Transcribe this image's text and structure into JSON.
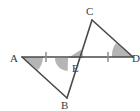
{
  "figure": {
    "background_color": "#ffffff",
    "stroke_color": "#4a4a4a",
    "angle_fill_color": "#9e9e9e",
    "label_color": "#3a3a3a",
    "points": {
      "A": {
        "x": 22,
        "y": 57,
        "label": "A",
        "label_x": 10,
        "label_y": 62
      },
      "B": {
        "x": 67,
        "y": 98,
        "label": "B",
        "label_x": 61,
        "label_y": 109
      },
      "C": {
        "x": 92,
        "y": 20,
        "label": "C",
        "label_x": 86,
        "label_y": 15
      },
      "D": {
        "x": 133,
        "y": 57,
        "label": "D",
        "label_x": 132,
        "label_y": 62
      },
      "E": {
        "x": 68,
        "y": 58,
        "label": "E",
        "label_x": 72,
        "label_y": 72
      }
    },
    "segments": [
      {
        "name": "segment-AD",
        "from": "A",
        "to": "D"
      },
      {
        "name": "segment-AB",
        "from": "A",
        "to": "B"
      },
      {
        "name": "segment-BC",
        "from": "B",
        "to": "C"
      },
      {
        "name": "segment-CD",
        "from": "C",
        "to": "D"
      }
    ],
    "tick_marks": [
      {
        "name": "tick-AE",
        "x": 46,
        "y": 57,
        "segment": "AE",
        "count": 1
      },
      {
        "name": "tick-ED",
        "x": 108,
        "y": 57,
        "segment": "ED",
        "count": 1
      }
    ],
    "angle_marks": [
      {
        "name": "angle-A",
        "vertex": "A",
        "shaded": true
      },
      {
        "name": "angle-D",
        "vertex": "D",
        "shaded": true
      },
      {
        "name": "angle-AEB",
        "vertex": "E",
        "shaded": true
      },
      {
        "name": "angle-CED",
        "vertex": "E",
        "shaded": true
      }
    ],
    "labels": [
      "A",
      "B",
      "C",
      "D",
      "E"
    ]
  }
}
